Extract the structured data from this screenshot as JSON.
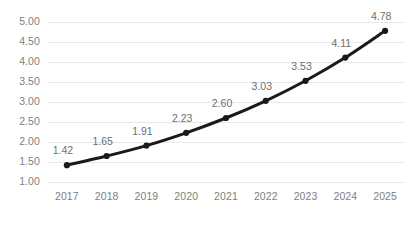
{
  "chart_data": {
    "type": "line",
    "title": "",
    "subtitle": "",
    "xlabel": "",
    "ylabel": "",
    "categories": [
      "2017",
      "2018",
      "2019",
      "2020",
      "2021",
      "2022",
      "2023",
      "2024",
      "2025"
    ],
    "values": [
      1.42,
      1.65,
      1.91,
      2.23,
      2.6,
      3.03,
      3.53,
      4.11,
      4.78
    ],
    "point_labels": [
      "1.42",
      "1.65",
      "1.91",
      "2.23",
      "2.60",
      "3.03",
      "3.53",
      "4.11",
      "4.78"
    ],
    "ylim": [
      1.0,
      5.0
    ],
    "ytick_values": [
      1.0,
      1.5,
      2.0,
      2.5,
      3.0,
      3.5,
      4.0,
      4.5,
      5.0
    ],
    "ytick_labels": [
      "1.00",
      "1.50",
      "2.00",
      "2.50",
      "3.00",
      "3.50",
      "4.00",
      "4.50",
      "5.00"
    ],
    "grid": {
      "horizontal": true,
      "vertical": false,
      "color": "#e8e8e8"
    },
    "legend": {
      "visible": false,
      "position": "none",
      "entries": []
    },
    "series": [
      {
        "name": "",
        "values": [
          1.42,
          1.65,
          1.91,
          2.23,
          2.6,
          3.03,
          3.53,
          4.11,
          4.78
        ],
        "line_color": "#1a1a1a",
        "marker_color": "#1a1a1a",
        "marker": "circle",
        "line_width": 3
      }
    ],
    "colors": {
      "background": "#ffffff",
      "line": "#1a1a1a",
      "marker": "#1a1a1a",
      "grid": "#e8e8e8",
      "tick_text": "#808080",
      "data_label_text": "#6e6e6e"
    }
  }
}
